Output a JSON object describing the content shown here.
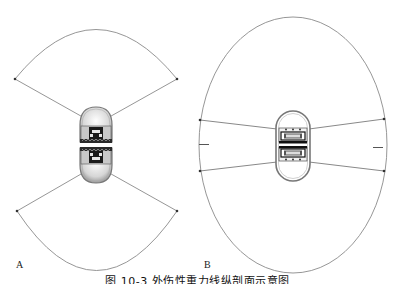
{
  "figure": {
    "caption": "图 10-3  外伤性重力线纵剖面示意图",
    "panels": [
      {
        "id": "A",
        "label": "A",
        "description": "Two opposing fan-shaped (sector) fields emanating from a pair of capsule devices facing each other",
        "fan_top": {
          "apex": [
            96,
            122
          ],
          "left_endpoint": [
            15,
            79
          ],
          "right_endpoint": [
            177,
            79
          ],
          "arc_top_y": 19
        },
        "fan_bottom": {
          "apex": [
            96,
            168
          ],
          "left_endpoint": [
            17,
            210
          ],
          "right_endpoint": [
            177,
            210
          ],
          "arc_bottom_y": 273
        }
      },
      {
        "id": "B",
        "label": "B",
        "description": "Near-elliptical combined field surrounding a pair of capsule devices inside an oval outline",
        "oval": {
          "cx": 293,
          "cy": 145,
          "rx": 94,
          "ry": 128
        },
        "upper_rays": {
          "left_endpoint": [
            200,
            120
          ],
          "right_endpoint": [
            384,
            120
          ]
        },
        "lower_rays": {
          "left_endpoint": [
            200,
            171
          ],
          "right_endpoint": [
            384,
            171
          ]
        },
        "side_marks": [
          "left",
          "right"
        ]
      }
    ]
  },
  "colors": {
    "line": "#7a7a7a",
    "device_dark": "#1a1a1a",
    "device_shell": "#d8d8d8",
    "dot": "#333333"
  }
}
